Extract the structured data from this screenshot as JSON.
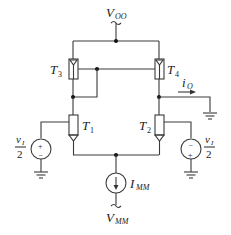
{
  "diagram": {
    "type": "circuit",
    "title": "",
    "supply_top": {
      "symbol": "V",
      "subscript": "OO"
    },
    "supply_bottom": {
      "symbol": "V",
      "subscript": "MM"
    },
    "current_source": {
      "symbol": "I",
      "subscript": "MM"
    },
    "output_current": {
      "symbol": "i",
      "subscript": "O"
    },
    "transistors": [
      {
        "id": "T3",
        "symbol": "T",
        "subscript": "3"
      },
      {
        "id": "T4",
        "symbol": "T",
        "subscript": "4"
      },
      {
        "id": "T1",
        "symbol": "T",
        "subscript": "1"
      },
      {
        "id": "T2",
        "symbol": "T",
        "subscript": "2"
      }
    ],
    "sources": [
      {
        "id": "left",
        "numerator": "v",
        "num_subscript": "I",
        "denominator": "2",
        "polarity_top": "+",
        "polarity_bottom": "−"
      },
      {
        "id": "right",
        "numerator": "v",
        "num_subscript": "I",
        "denominator": "2",
        "polarity_top": "−",
        "polarity_bottom": "+"
      }
    ]
  }
}
